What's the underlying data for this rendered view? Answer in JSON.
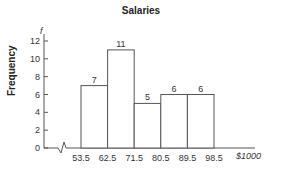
{
  "chart_data": {
    "type": "bar",
    "title": "Salaries",
    "xlabel": "$1000",
    "ylabel": "Frequency",
    "y_axis_symbol": "f",
    "bin_edges": [
      53.5,
      62.5,
      71.5,
      80.5,
      89.5,
      98.5
    ],
    "categories": [
      "53.5-62.5",
      "62.5-71.5",
      "71.5-80.5",
      "80.5-89.5",
      "89.5-98.5"
    ],
    "values": [
      7,
      11,
      5,
      6,
      6
    ],
    "data_labels": [
      "7",
      "11",
      "5",
      "6",
      "6"
    ],
    "x_tick_labels": [
      "53.5",
      "62.5",
      "71.5",
      "80.5",
      "89.5",
      "98.5"
    ],
    "y_tick_labels": [
      "0",
      "2",
      "4",
      "6",
      "8",
      "10",
      "12"
    ],
    "ylim": [
      0,
      12
    ],
    "axis_break": true,
    "grid": false,
    "legend": null
  }
}
